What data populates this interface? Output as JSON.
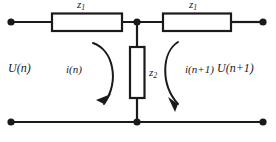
{
  "diagram": {
    "line_color": "#1a1a1a",
    "background_color": "#ffffff",
    "labels": {
      "series_impedance_left": "z",
      "series_impedance_left_sub": "1",
      "series_impedance_right": "z",
      "series_impedance_right_sub": "1",
      "shunt_impedance": "z",
      "shunt_impedance_sub": "2",
      "voltage_left": "U(n)",
      "voltage_right": "U(n+1)",
      "current_left": "i(n)",
      "current_right": "i(n+1)"
    },
    "components": [
      {
        "name": "series-resistor-left",
        "label": "z1",
        "orientation": "horizontal"
      },
      {
        "name": "series-resistor-right",
        "label": "z1",
        "orientation": "horizontal"
      },
      {
        "name": "shunt-resistor-middle",
        "label": "z2",
        "orientation": "vertical"
      }
    ],
    "terminals": [
      {
        "name": "input-top-terminal",
        "x": 11,
        "y": 22
      },
      {
        "name": "input-bottom-terminal",
        "x": 11,
        "y": 122
      },
      {
        "name": "output-top-terminal",
        "x": 263,
        "y": 22
      },
      {
        "name": "output-bottom-terminal",
        "x": 263,
        "y": 122
      }
    ],
    "junctions": [
      {
        "name": "top-center-junction",
        "x": 137,
        "y": 22
      },
      {
        "name": "bottom-center-junction",
        "x": 137,
        "y": 122
      }
    ],
    "loop_arrows": [
      {
        "name": "left-mesh-current-arrow",
        "direction": "clockwise"
      },
      {
        "name": "right-mesh-current-arrow",
        "direction": "clockwise"
      }
    ]
  }
}
